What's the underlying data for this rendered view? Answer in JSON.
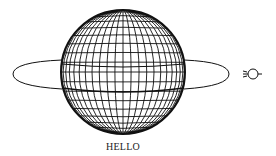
{
  "diagram": {
    "label": "HELLO",
    "line_color": "#111111",
    "background": "#ffffff",
    "globe": {
      "cx": 123,
      "cy": 72,
      "r": 62,
      "meridians": 24,
      "parallels": 20
    },
    "ring": {
      "cx": 121,
      "cy": 74,
      "rx": 108,
      "ry": 16
    },
    "symbol": "small-circle-with-rays"
  }
}
